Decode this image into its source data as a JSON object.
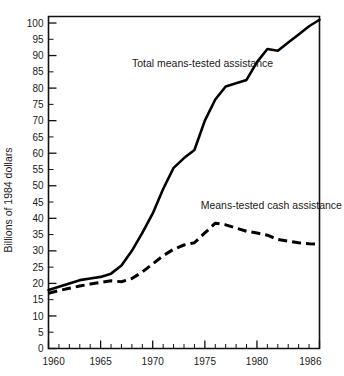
{
  "chart_data": {
    "type": "line",
    "title": "",
    "xlabel": "",
    "ylabel": "Billions of 1984 dollars",
    "xlim": [
      1960,
      1986
    ],
    "ylim": [
      0,
      102
    ],
    "grid": false,
    "legend_position": "inline-annotation",
    "x_tick_labels": [
      "1960",
      "1965",
      "1970",
      "1975",
      "1980",
      "1986"
    ],
    "x_tick_values": [
      1960,
      1965,
      1970,
      1975,
      1980,
      1986
    ],
    "x_minor_tick_step": 1,
    "y_tick_labels": [
      "0",
      "5",
      "10",
      "15",
      "20",
      "25",
      "30",
      "35",
      "40",
      "45",
      "50",
      "55",
      "60",
      "65",
      "70",
      "75",
      "80",
      "85",
      "90",
      "95",
      "100"
    ],
    "y_tick_values": [
      0,
      5,
      10,
      15,
      20,
      25,
      30,
      35,
      40,
      45,
      50,
      55,
      60,
      65,
      70,
      75,
      80,
      85,
      90,
      95,
      100
    ],
    "x": [
      1960,
      1961,
      1962,
      1963,
      1964,
      1965,
      1966,
      1967,
      1968,
      1969,
      1970,
      1971,
      1972,
      1973,
      1974,
      1975,
      1976,
      1977,
      1978,
      1979,
      1980,
      1981,
      1982,
      1983,
      1984,
      1985,
      1986
    ],
    "series": [
      {
        "name": "Total means-tested assistance",
        "style": "solid",
        "color": "#000000",
        "label_text": "Total means-tested assistance",
        "values": [
          18.0,
          19.0,
          20.0,
          21.0,
          21.5,
          22.0,
          23.0,
          25.5,
          30.0,
          35.5,
          41.5,
          49.0,
          55.5,
          58.5,
          61.0,
          70.0,
          76.5,
          80.5,
          81.5,
          82.5,
          88.0,
          92.0,
          91.5,
          94.0,
          96.5,
          99.0,
          101.0
        ]
      },
      {
        "name": "Means-tested cash assistance",
        "style": "dashed",
        "color": "#000000",
        "label_text": "Means-tested cash assistance",
        "values": [
          17.0,
          17.8,
          18.5,
          19.2,
          19.8,
          20.3,
          20.8,
          20.5,
          21.5,
          23.5,
          26.0,
          28.5,
          30.5,
          31.8,
          32.5,
          35.5,
          38.5,
          38.0,
          37.0,
          36.0,
          35.5,
          34.8,
          33.5,
          33.0,
          32.5,
          32.2,
          32.0
        ]
      }
    ],
    "annotations": [
      {
        "text": "Total means-tested assistance",
        "x": 1968.0,
        "y": 86.5,
        "anchor": "start"
      },
      {
        "text": "Means-tested cash assistance",
        "x": 1974.6,
        "y": 43.0,
        "anchor": "start"
      }
    ]
  }
}
